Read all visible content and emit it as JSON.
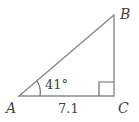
{
  "figure": {
    "type": "right-triangle",
    "vertices": {
      "A": {
        "label": "A"
      },
      "B": {
        "label": "B"
      },
      "C": {
        "label": "C"
      }
    },
    "angle_A": {
      "label": "41°",
      "value_deg": 41
    },
    "side_AC": {
      "label": "7.1",
      "value": 7.1
    },
    "right_angle_at": "C",
    "colors": {
      "lines": "#8a8a8a",
      "text": "#444444",
      "background": "#ffffff"
    }
  }
}
